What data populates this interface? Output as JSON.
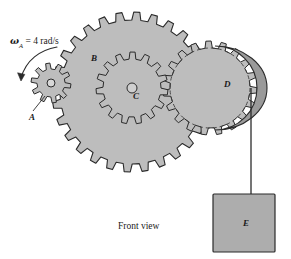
{
  "figure": {
    "caption": "Front view",
    "angular_velocity_label": {
      "symbol": "ω",
      "subscript": "A",
      "equals": " = 4 rad/s",
      "full": "ωA = 4 rad/s"
    },
    "parts": [
      {
        "id": "A",
        "label": "A",
        "type": "gear",
        "role": "driver-gear"
      },
      {
        "id": "B",
        "label": "B",
        "type": "gear",
        "role": "large-gear"
      },
      {
        "id": "C",
        "label": "C",
        "type": "gear",
        "role": "inner-gear"
      },
      {
        "id": "D",
        "label": "D",
        "type": "drum",
        "role": "pulley-drum"
      },
      {
        "id": "E",
        "label": "E",
        "type": "block",
        "role": "hanging-weight"
      }
    ],
    "colors": {
      "gear_fill": "#bdbdbd",
      "drum_fill": "#9a9a9a",
      "block_fill": "#adadad",
      "outline": "#2b2b2b",
      "background": "#ffffff",
      "hidden_line": "#4a4a4a"
    },
    "geometry": {
      "gear_a": {
        "cx": 51,
        "cy": 83,
        "outer_r": 20,
        "root_r": 14,
        "teeth": 10,
        "hub_r": 4
      },
      "gear_b": {
        "cx": 132,
        "cy": 92,
        "outer_r": 80,
        "root_r": 72,
        "teeth": 28
      },
      "gear_c": {
        "cx": 132,
        "cy": 92,
        "outer_r": 36,
        "root_r": 29,
        "teeth": 15,
        "hub_r": 5
      },
      "gear_hidden": {
        "cx": 210,
        "cy": 88,
        "outer_r": 47,
        "root_r": 40,
        "teeth": 19
      },
      "drum_d": {
        "cx": 215,
        "cy": 88,
        "r": 42
      },
      "block_e": {
        "x": 213,
        "y": 194,
        "w": 62,
        "h": 58
      },
      "cord": {
        "x": 251,
        "y1": 88,
        "y2": 194
      }
    }
  }
}
